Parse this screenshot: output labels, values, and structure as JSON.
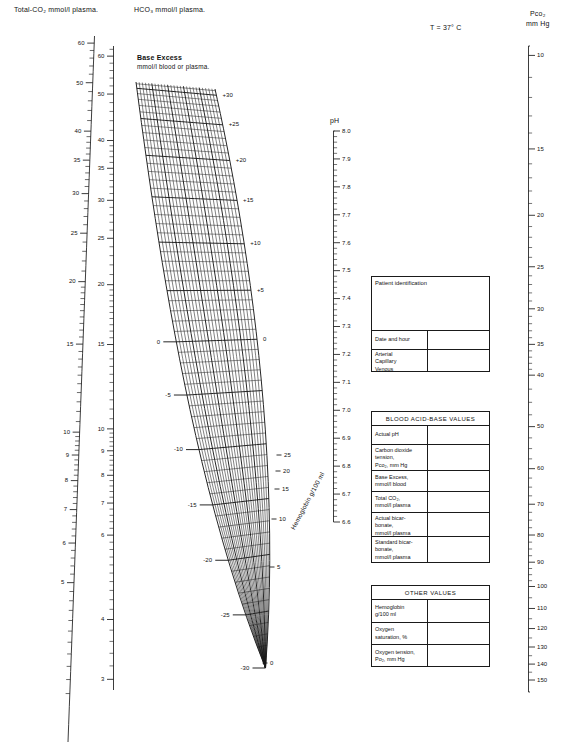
{
  "chart_data": {
    "type": "line",
    "temperature_note": "T = 37° C",
    "axes": [
      {
        "name": "total-co2",
        "label": "Total-CO₂ mmol/l plasma.",
        "orientation": "vertical-left",
        "range": [
          3,
          60
        ],
        "major_ticks": [
          60,
          50,
          40,
          35,
          30,
          25,
          20,
          15,
          10,
          9,
          8,
          7,
          6,
          5
        ],
        "labelled": [
          "60",
          "50",
          "40",
          "35",
          "30",
          "25",
          "20",
          "15",
          "10",
          "9",
          "8",
          "7",
          "6",
          "5"
        ]
      },
      {
        "name": "hco3",
        "label": "HCO₃ mmol/l plasma.",
        "orientation": "vertical-left",
        "range": [
          3,
          62
        ],
        "labelled": [
          "60",
          "50",
          "40",
          "35",
          "30",
          "25",
          "20",
          "15",
          "10",
          "9",
          "8",
          "7",
          "6",
          "4",
          "3"
        ]
      },
      {
        "name": "ph",
        "label": "pH",
        "orientation": "vertical-middle",
        "range": [
          6.6,
          8.0
        ],
        "labelled": [
          "8.0",
          "7.9",
          "7.8",
          "7.7",
          "7.6",
          "7.5",
          "7.4",
          "7.3",
          "7.2",
          "7.1",
          "7.0",
          "6.9",
          "6.8",
          "6.7",
          "6.6"
        ]
      },
      {
        "name": "pco2",
        "label": "Pᴄᴏ₂ mm Hg",
        "orientation": "vertical-right",
        "range": [
          10,
          150
        ],
        "labelled": [
          "10",
          "15",
          "20",
          "25",
          "30",
          "35",
          "40",
          "50",
          "60",
          "70",
          "80",
          "90",
          "100",
          "110",
          "120",
          "130",
          "140",
          "150"
        ]
      },
      {
        "name": "base-excess",
        "label": "Base Excess mmol/l blood or plasma.",
        "orientation": "oblique-grid",
        "range": [
          -30,
          30
        ],
        "labelled_left": [
          "0",
          "-5",
          "-10",
          "-15",
          "-20",
          "-25",
          "-30"
        ],
        "labelled_right": [
          "+30",
          "+25",
          "+20",
          "+15",
          "+10",
          "+5",
          "0"
        ]
      },
      {
        "name": "hemoglobin",
        "label": "Hemoglobin  g/100 ml",
        "orientation": "oblique-grid",
        "range": [
          0,
          25
        ],
        "labelled": [
          "25",
          "20",
          "15",
          "10",
          "5",
          "0"
        ]
      }
    ]
  },
  "axis_titles": {
    "total_co2": "Total-CO₂ mmol/l plasma.",
    "hco3": "HCO₃ mmol/l plasma.",
    "ph": "pH",
    "pco2_line1": "Pᴄᴏ₂",
    "pco2_line2": "mm Hg",
    "base_excess_line1": "Base Excess",
    "base_excess_line2": "mmol/l blood or plasma.",
    "hemoglobin": "Hemoglobin  g/100 ml",
    "temperature": "T = 37° C"
  },
  "ticks": {
    "total_co2": [
      {
        "v": 60,
        "label": "60"
      },
      {
        "v": 50,
        "label": "50"
      },
      {
        "v": 40,
        "label": "40"
      },
      {
        "v": 35,
        "label": "35"
      },
      {
        "v": 30,
        "label": "30"
      },
      {
        "v": 25,
        "label": "25"
      },
      {
        "v": 20,
        "label": "20"
      },
      {
        "v": 15,
        "label": "15"
      },
      {
        "v": 10,
        "label": "10"
      },
      {
        "v": 9,
        "label": "9"
      },
      {
        "v": 8,
        "label": "8"
      },
      {
        "v": 7,
        "label": "7"
      },
      {
        "v": 6,
        "label": "6"
      },
      {
        "v": 5,
        "label": "5"
      }
    ],
    "hco3": [
      {
        "v": 60,
        "label": "60"
      },
      {
        "v": 50,
        "label": "50"
      },
      {
        "v": 40,
        "label": "40"
      },
      {
        "v": 35,
        "label": "35"
      },
      {
        "v": 30,
        "label": "30"
      },
      {
        "v": 25,
        "label": "25"
      },
      {
        "v": 20,
        "label": "20"
      },
      {
        "v": 15,
        "label": "15"
      },
      {
        "v": 10,
        "label": "10"
      },
      {
        "v": 9,
        "label": "9"
      },
      {
        "v": 8,
        "label": "8"
      },
      {
        "v": 7,
        "label": "7"
      },
      {
        "v": 6,
        "label": "6"
      },
      {
        "v": 4,
        "label": "4"
      },
      {
        "v": 3,
        "label": "3"
      }
    ],
    "ph": [
      "8.0",
      "7.9",
      "7.8",
      "7.7",
      "7.6",
      "7.5",
      "7.4",
      "7.3",
      "7.2",
      "7.1",
      "7.0",
      "6.9",
      "6.8",
      "6.7",
      "6.6"
    ],
    "pco2": [
      {
        "label": "10"
      },
      {
        "label": "15"
      },
      {
        "label": "20"
      },
      {
        "label": "25"
      },
      {
        "label": "30"
      },
      {
        "label": "35"
      },
      {
        "label": "40"
      },
      {
        "label": "50"
      },
      {
        "label": "60"
      },
      {
        "label": "70"
      },
      {
        "label": "80"
      },
      {
        "label": "90"
      },
      {
        "label": "100"
      },
      {
        "label": "110"
      },
      {
        "label": "120"
      },
      {
        "label": "130"
      },
      {
        "label": "140"
      },
      {
        "label": "150"
      }
    ],
    "base_excess_right": [
      "+30",
      "+25",
      "+20",
      "+15",
      "+10",
      "+5",
      "0"
    ],
    "base_excess_left": [
      "0",
      "-5",
      "-10",
      "-15",
      "-20",
      "-25",
      "-30"
    ],
    "hemoglobin": [
      "25",
      "20",
      "15",
      "10",
      "5",
      "0"
    ]
  },
  "patient_box": {
    "identification_label": "Patient identification",
    "date_label": "Date and hour",
    "sample_label": "Arterial\nCapillary\nVenous"
  },
  "acid_base_box": {
    "title": "BLOOD ACID-BASE VALUES",
    "rows": [
      {
        "label": "Actual pH"
      },
      {
        "label": "Carbon dioxide\ntension,\nPco₂, mm Hg"
      },
      {
        "label": "Base Excess,\nmmol/l blood"
      },
      {
        "label": "Total CO₂,\nmmol/l plasma"
      },
      {
        "label": "Actual bicar-\nbonate,\nmmol/l plasma"
      },
      {
        "label": "Standard bicar-\nbonate,\nmmol/l plasma"
      }
    ]
  },
  "other_box": {
    "title": "OTHER VALUES",
    "rows": [
      {
        "label": "Hemoglobin\ng/100 ml"
      },
      {
        "label": "Oxygen\nsaturation, %"
      },
      {
        "label": "Oxygen tension,\nPo₂, mm Hg"
      }
    ]
  },
  "colors": {
    "ink": "#1a1a1a",
    "paper": "#ffffff"
  }
}
